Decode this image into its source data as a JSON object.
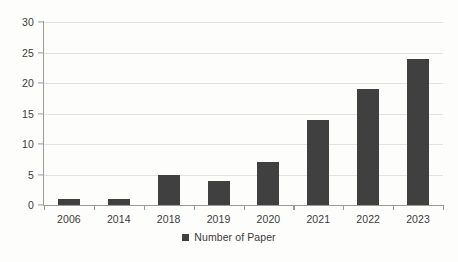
{
  "chart_data": {
    "type": "bar",
    "title": "",
    "subtitle": "",
    "xlabel": "",
    "ylabel": "",
    "categories": [
      "2006",
      "2014",
      "2018",
      "2019",
      "2020",
      "2021",
      "2022",
      "2023"
    ],
    "values": [
      1,
      1,
      5,
      4,
      7,
      14,
      19,
      24
    ],
    "series": [
      {
        "name": "Number of Paper",
        "values": [
          1,
          1,
          5,
          4,
          7,
          14,
          19,
          24
        ],
        "color": "#404040"
      }
    ],
    "ylim": [
      0,
      30
    ],
    "ytick_step": 5,
    "yticks": [
      0,
      5,
      10,
      15,
      20,
      25,
      30
    ],
    "ytick_labels": [
      "0",
      "5",
      "10",
      "15",
      "20",
      "25",
      "30"
    ],
    "grid": true,
    "grid_axis": "y",
    "grid_color": "#e2e2e2",
    "legend": {
      "position": "bottom-center",
      "entries": [
        {
          "label": "Number of Paper",
          "color": "#404040",
          "marker": "square"
        }
      ]
    },
    "axis_color": "#9a9a9a",
    "background": "#fdfdfb",
    "text_color": "#3b3b3b"
  }
}
